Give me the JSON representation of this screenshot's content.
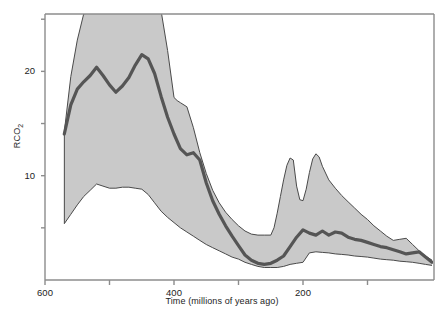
{
  "figure": {
    "cropped_top_text": "",
    "y_axis_label": "RCO",
    "y_axis_label_sub": "2",
    "x_axis_label": "Time (millions of years ago)"
  },
  "ticks": {
    "y": [
      {
        "label": "20",
        "value": 20
      },
      {
        "label": "10",
        "value": 10
      }
    ],
    "x": [
      {
        "label": "600",
        "value": 600
      },
      {
        "label": "400",
        "value": 400
      },
      {
        "label": "200",
        "value": 200
      }
    ]
  },
  "chart_data": {
    "type": "line",
    "title": "",
    "xlabel": "Time (millions of years ago)",
    "ylabel": "RCO2",
    "xlim": [
      600,
      0
    ],
    "ylim": [
      0,
      25.5
    ],
    "x_reversed": true,
    "grid": false,
    "legend": null,
    "colors": {
      "band_fill": "#c9c9c9",
      "band_edge": "#4a4a4a",
      "center_line": "#555555",
      "axis": "#8c8c8c",
      "text": "#1d1d1d"
    },
    "x_tick_values": [
      600,
      500,
      400,
      300,
      200,
      100
    ],
    "x_minor_ticks": [
      500,
      300,
      100
    ],
    "y_tick_values": [
      20,
      10
    ],
    "y_minor_ticks": [
      25,
      15,
      5
    ],
    "series": [
      {
        "name": "RCO2 best estimate",
        "style": "thick-line",
        "x": [
          570,
          560,
          550,
          540,
          530,
          520,
          510,
          500,
          490,
          480,
          470,
          460,
          450,
          440,
          430,
          420,
          410,
          400,
          390,
          380,
          370,
          360,
          350,
          340,
          330,
          320,
          310,
          300,
          290,
          280,
          270,
          260,
          250,
          240,
          230,
          220,
          210,
          200,
          190,
          180,
          170,
          160,
          150,
          140,
          130,
          120,
          110,
          100,
          90,
          80,
          70,
          60,
          50,
          40,
          30,
          20,
          10,
          0
        ],
        "values": [
          14.0,
          16.8,
          18.3,
          19.0,
          19.6,
          20.4,
          19.6,
          18.7,
          18.0,
          18.6,
          19.4,
          20.6,
          21.6,
          21.2,
          19.8,
          17.6,
          15.6,
          14.0,
          12.6,
          12.0,
          12.2,
          11.5,
          9.3,
          7.6,
          6.3,
          5.2,
          4.2,
          3.3,
          2.4,
          1.9,
          1.6,
          1.5,
          1.6,
          1.9,
          2.3,
          3.2,
          4.1,
          4.8,
          4.5,
          4.3,
          4.7,
          4.3,
          4.6,
          4.5,
          4.1,
          3.9,
          3.8,
          3.6,
          3.4,
          3.2,
          3.1,
          2.9,
          2.7,
          2.5,
          2.6,
          2.7,
          2.2,
          1.7
        ]
      },
      {
        "name": "Upper uncertainty bound",
        "style": "band-upper",
        "x": [
          570,
          560,
          550,
          540,
          520,
          500,
          470,
          440,
          420,
          410,
          400,
          395,
          390,
          380,
          370,
          360,
          350,
          340,
          330,
          320,
          310,
          300,
          290,
          280,
          270,
          260,
          250,
          245,
          240,
          235,
          230,
          225,
          220,
          215,
          210,
          205,
          200,
          195,
          190,
          185,
          180,
          175,
          170,
          160,
          150,
          140,
          130,
          120,
          110,
          100,
          90,
          80,
          70,
          60,
          50,
          40,
          30,
          20,
          10,
          0
        ],
        "values": [
          14.2,
          19.5,
          23.0,
          25.5,
          25.8,
          25.8,
          25.8,
          25.8,
          25.8,
          22.0,
          17.5,
          17.2,
          17.0,
          16.6,
          14.6,
          12.2,
          10.2,
          8.6,
          7.4,
          6.5,
          5.8,
          5.2,
          4.7,
          4.4,
          4.3,
          4.3,
          4.3,
          5.0,
          6.4,
          8.0,
          9.6,
          11.0,
          11.7,
          11.5,
          9.0,
          7.7,
          7.6,
          8.7,
          10.3,
          11.6,
          12.1,
          11.8,
          10.9,
          9.6,
          8.8,
          8.1,
          7.5,
          6.9,
          6.3,
          5.8,
          5.2,
          4.7,
          4.2,
          3.8,
          3.9,
          4.0,
          3.4,
          2.8,
          2.3,
          1.9
        ]
      },
      {
        "name": "Lower uncertainty bound",
        "style": "band-lower",
        "x": [
          570,
          560,
          550,
          540,
          530,
          520,
          510,
          500,
          490,
          480,
          470,
          460,
          450,
          440,
          430,
          420,
          410,
          400,
          390,
          380,
          370,
          360,
          350,
          340,
          330,
          320,
          310,
          300,
          290,
          280,
          270,
          260,
          250,
          240,
          230,
          225,
          220,
          210,
          200,
          190,
          180,
          170,
          160,
          150,
          140,
          130,
          120,
          110,
          100,
          90,
          80,
          70,
          60,
          50,
          40,
          30,
          20,
          10,
          0
        ],
        "values": [
          5.4,
          6.3,
          7.2,
          8.0,
          8.6,
          9.2,
          9.0,
          8.8,
          8.8,
          8.9,
          8.9,
          8.8,
          8.7,
          8.2,
          7.4,
          6.6,
          6.0,
          5.5,
          5.0,
          4.6,
          4.2,
          3.8,
          3.4,
          3.1,
          2.8,
          2.5,
          2.2,
          2.0,
          1.7,
          1.5,
          1.3,
          1.2,
          1.2,
          1.2,
          1.3,
          1.4,
          1.5,
          1.6,
          1.7,
          2.6,
          2.7,
          2.65,
          2.6,
          2.5,
          2.45,
          2.4,
          2.3,
          2.25,
          2.2,
          2.1,
          2.0,
          1.95,
          1.9,
          1.8,
          1.75,
          1.7,
          1.6,
          1.5,
          1.4
        ]
      }
    ]
  }
}
